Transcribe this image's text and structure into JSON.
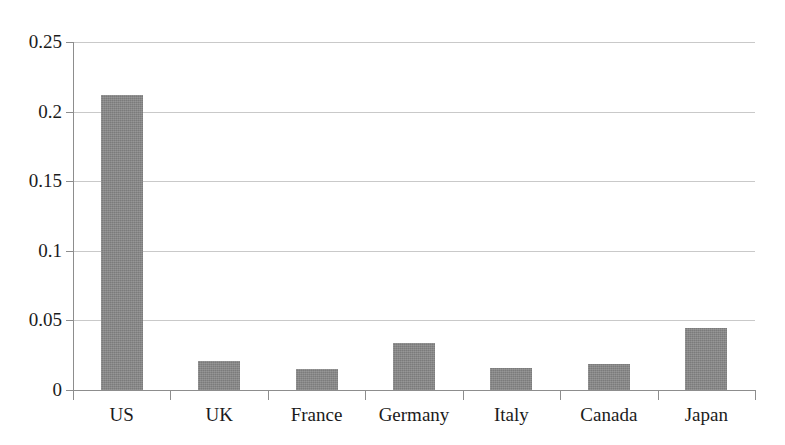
{
  "chart_data": {
    "type": "bar",
    "title": "",
    "subtitle": "",
    "xlabel": "",
    "ylabel": "",
    "categories": [
      "US",
      "UK",
      "France",
      "Germany",
      "Italy",
      "Canada",
      "Japan"
    ],
    "values": [
      0.212,
      0.021,
      0.015,
      0.034,
      0.016,
      0.019,
      0.0445
    ],
    "ylim": [
      0,
      0.25
    ],
    "y_ticks": [
      0,
      0.05,
      0.1,
      0.15,
      0.2,
      0.25
    ],
    "y_tick_labels": [
      "0",
      "0.05",
      "0.1",
      "0.15",
      "0.2",
      "0.25"
    ],
    "grid": true,
    "grid_axis": "y",
    "legend": false,
    "legend_position": "none",
    "series": [
      {
        "name": "",
        "values": [
          0.212,
          0.021,
          0.015,
          0.034,
          0.016,
          0.019,
          0.0445
        ]
      }
    ],
    "colors": {
      "bar_fill": "#878787",
      "gridline": "#c9c9c9",
      "axis_line": "#8d8d8d",
      "text": "#1b1b1b",
      "background": "#ffffff"
    }
  }
}
